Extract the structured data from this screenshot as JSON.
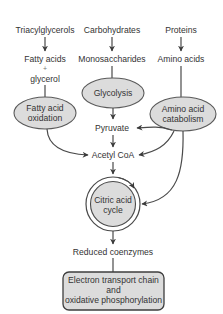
{
  "diagram": {
    "sources": {
      "lipids": "Triacylglycerols",
      "carbohydrates": "Carbohydrates",
      "proteins": "Proteins"
    },
    "products": {
      "fatty_acids": "Fatty acids",
      "plus": "+",
      "glycerol": "glycerol",
      "monosaccharides": "Monosaccharides",
      "amino_acids": "Amino acids"
    },
    "processes": {
      "fatty_acid_oxidation": [
        "Fatty acid",
        "oxidation"
      ],
      "glycolysis": "Glycolysis",
      "amino_acid_catabolism": [
        "Amino acid",
        "catabolism"
      ],
      "citric_acid_cycle": [
        "Citric acid",
        "cycle"
      ]
    },
    "intermediates": {
      "pyruvate": "Pyruvate",
      "acetyl_coa": "Acetyl CoA",
      "reduced_coenzymes": "Reduced coenzymes"
    },
    "final": {
      "lines": [
        "Electron transport chain",
        "and",
        "oxidative phosphorylation"
      ]
    },
    "colors": {
      "node_fill": "#dcdcdc",
      "stroke": "#4a4a4a",
      "text": "#333333"
    }
  }
}
